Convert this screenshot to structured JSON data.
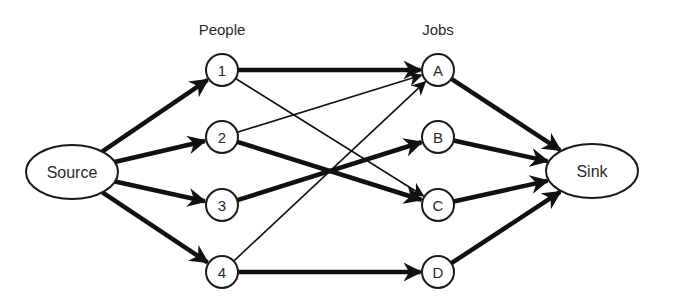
{
  "diagram": {
    "type": "bipartite-flow-network",
    "column_labels": {
      "people": "People",
      "jobs": "Jobs"
    },
    "source": {
      "id": "source",
      "label": "Source",
      "cx": 72,
      "cy": 172,
      "rx": 46,
      "ry": 27
    },
    "sink": {
      "id": "sink",
      "label": "Sink",
      "cx": 592,
      "cy": 171,
      "rx": 46,
      "ry": 27
    },
    "people": [
      {
        "id": "p1",
        "label": "1",
        "cx": 222,
        "cy": 70
      },
      {
        "id": "p2",
        "label": "2",
        "cx": 222,
        "cy": 137
      },
      {
        "id": "p3",
        "label": "3",
        "cx": 222,
        "cy": 205
      },
      {
        "id": "p4",
        "label": "4",
        "cx": 222,
        "cy": 272
      }
    ],
    "jobs": [
      {
        "id": "jA",
        "label": "A",
        "cx": 438,
        "cy": 70
      },
      {
        "id": "jB",
        "label": "B",
        "cx": 438,
        "cy": 137
      },
      {
        "id": "jC",
        "label": "C",
        "cx": 438,
        "cy": 205
      },
      {
        "id": "jD",
        "label": "D",
        "cx": 438,
        "cy": 272
      }
    ],
    "node_radius": 16,
    "edges": [
      {
        "from": "source",
        "to": "p1",
        "weight": "thick"
      },
      {
        "from": "source",
        "to": "p2",
        "weight": "thick"
      },
      {
        "from": "source",
        "to": "p3",
        "weight": "thick"
      },
      {
        "from": "source",
        "to": "p4",
        "weight": "thick"
      },
      {
        "from": "p1",
        "to": "jA",
        "weight": "thick"
      },
      {
        "from": "p1",
        "to": "jC",
        "weight": "thin"
      },
      {
        "from": "p2",
        "to": "jA",
        "weight": "thin"
      },
      {
        "from": "p2",
        "to": "jC",
        "weight": "thick"
      },
      {
        "from": "p3",
        "to": "jB",
        "weight": "thick"
      },
      {
        "from": "p4",
        "to": "jA",
        "weight": "thin"
      },
      {
        "from": "p4",
        "to": "jD",
        "weight": "thick"
      },
      {
        "from": "jA",
        "to": "sink",
        "weight": "thick"
      },
      {
        "from": "jB",
        "to": "sink",
        "weight": "thick"
      },
      {
        "from": "jC",
        "to": "sink",
        "weight": "thick"
      },
      {
        "from": "jD",
        "to": "sink",
        "weight": "thick"
      }
    ],
    "colors": {
      "stroke": "#111111",
      "text": "#2a2a2a",
      "background": "#ffffff"
    }
  }
}
